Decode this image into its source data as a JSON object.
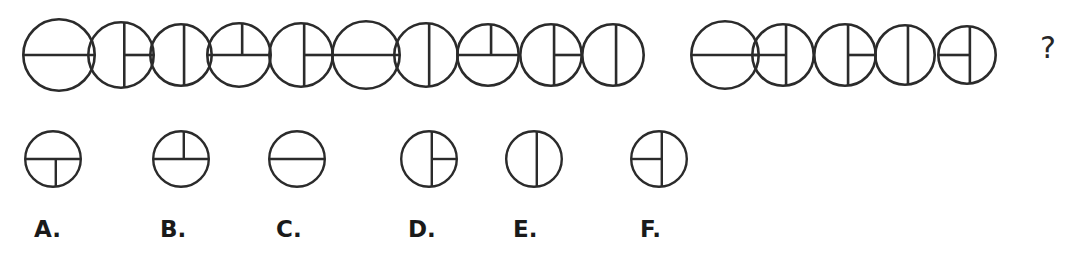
{
  "question": {
    "prompt_symbol": "?",
    "stroke_color": "#2b2b2b",
    "background_color": "#ffffff",
    "sequence_label": "circle-sequence",
    "sequence": [
      {
        "index": 1,
        "name": "circle-h-full",
        "lines": [
          "horizontal-full"
        ]
      },
      {
        "index": 2,
        "name": "circle-v-full-h-right",
        "lines": [
          "vertical-full",
          "horizontal-right-half"
        ]
      },
      {
        "index": 3,
        "name": "circle-v-full",
        "lines": [
          "vertical-full"
        ]
      },
      {
        "index": 4,
        "name": "circle-h-full-v-top",
        "lines": [
          "horizontal-full",
          "vertical-top-half"
        ]
      },
      {
        "index": 5,
        "name": "circle-v-full-h-right",
        "lines": [
          "vertical-full",
          "horizontal-right-half"
        ]
      },
      {
        "index": 6,
        "name": "circle-h-full",
        "lines": [
          "horizontal-full"
        ]
      },
      {
        "index": 7,
        "name": "circle-v-full",
        "lines": [
          "vertical-full"
        ]
      },
      {
        "index": 8,
        "name": "circle-h-full-v-top",
        "lines": [
          "horizontal-full",
          "vertical-top-half"
        ]
      },
      {
        "index": 9,
        "name": "circle-v-full-h-right",
        "lines": [
          "vertical-full",
          "horizontal-right-half"
        ]
      },
      {
        "index": 10,
        "name": "circle-v-full",
        "lines": [
          "vertical-full"
        ]
      },
      {
        "index": 11,
        "name": "circle-h-full",
        "lines": [
          "horizontal-full"
        ]
      },
      {
        "index": 12,
        "name": "circle-v-full-h-left",
        "lines": [
          "vertical-full",
          "horizontal-left-half"
        ]
      },
      {
        "index": 13,
        "name": "circle-v-full-h-right",
        "lines": [
          "vertical-full",
          "horizontal-right-half"
        ]
      },
      {
        "index": 14,
        "name": "circle-v-full",
        "lines": [
          "vertical-full"
        ]
      },
      {
        "index": 15,
        "name": "circle-v-full-h-left",
        "lines": [
          "vertical-full",
          "horizontal-left-half"
        ]
      }
    ]
  },
  "options": [
    {
      "letter": "A.",
      "name": "option-a",
      "lines": [
        "horizontal-full",
        "vertical-bottom-half"
      ]
    },
    {
      "letter": "B.",
      "name": "option-b",
      "lines": [
        "horizontal-full",
        "vertical-top-half"
      ]
    },
    {
      "letter": "C.",
      "name": "option-c",
      "lines": [
        "horizontal-full"
      ]
    },
    {
      "letter": "D.",
      "name": "option-d",
      "lines": [
        "vertical-full",
        "horizontal-right-half"
      ]
    },
    {
      "letter": "E.",
      "name": "option-e",
      "lines": [
        "vertical-full"
      ]
    },
    {
      "letter": "F.",
      "name": "option-f",
      "lines": [
        "vertical-full",
        "horizontal-left-half"
      ]
    }
  ],
  "layout": {
    "sequence": {
      "y": 16,
      "size": 70,
      "x_positions": [
        22,
        87,
        149,
        206,
        268,
        331,
        393,
        456,
        519,
        581,
        690,
        751,
        813,
        874,
        937
      ],
      "circle_radii": [
        35,
        32,
        30,
        31,
        31,
        33,
        31,
        30,
        30,
        30,
        33,
        30,
        30,
        29,
        28
      ]
    },
    "question_mark": {
      "x": 1040,
      "y": 33
    },
    "options": {
      "y": 130,
      "size": 58,
      "x_positions": [
        24,
        152,
        268,
        400,
        505,
        630
      ],
      "label_y": 218,
      "label_x_positions": [
        34,
        160,
        276,
        408,
        513,
        640
      ]
    }
  }
}
